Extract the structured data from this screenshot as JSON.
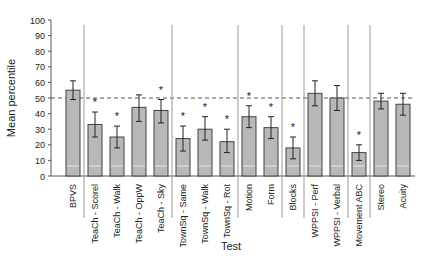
{
  "chart_data": {
    "type": "bar",
    "title": "",
    "xlabel": "Test",
    "ylabel": "Mean percentile",
    "ylim": [
      0,
      100
    ],
    "yticks": [
      0,
      10,
      20,
      30,
      40,
      50,
      60,
      70,
      80,
      90,
      100
    ],
    "reference_line": {
      "y": 50,
      "style": "dashed"
    },
    "grid": false,
    "legend": null,
    "categories": [
      "BPVS",
      "TeaCh - Scorel",
      "TeaCh - Walk",
      "TeaCh - OppW",
      "TeaCh - Sky",
      "TownSq - Same",
      "TownSq - Walk",
      "TownSq - Rot",
      "Motion",
      "Form",
      "Blocks",
      "WPPSI - Perf",
      "WPPSI - Verbal",
      "Movement ABC",
      "Stereo",
      "Acuity"
    ],
    "values": [
      55,
      33,
      25,
      44,
      42,
      24,
      30,
      22,
      38,
      31,
      18,
      53,
      50,
      15,
      48,
      46
    ],
    "error_low": [
      49,
      25,
      18,
      35,
      34,
      16,
      23,
      15,
      31,
      24,
      11,
      45,
      42,
      10,
      43,
      39
    ],
    "error_high": [
      61,
      41,
      32,
      52,
      49,
      32,
      38,
      30,
      45,
      38,
      25,
      61,
      58,
      20,
      53,
      53
    ],
    "significant": [
      false,
      true,
      true,
      false,
      true,
      true,
      true,
      true,
      true,
      true,
      true,
      false,
      false,
      true,
      false,
      false
    ],
    "significance_marker": "*",
    "group_separators_after": [
      0,
      4,
      7,
      9,
      10,
      12,
      13
    ],
    "bar_color": "#b8b8b8",
    "bar_edge_color": "#444444"
  }
}
